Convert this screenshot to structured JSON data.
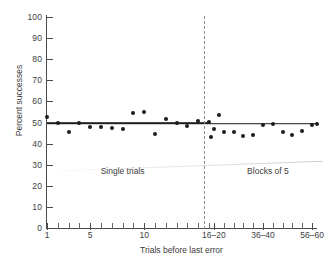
{
  "chart_data": {
    "type": "scatter",
    "title": "",
    "xlabel": "Trials before last error",
    "ylabel": "Percent successes",
    "ylim": [
      0,
      100
    ],
    "ytick_values": [
      0,
      10,
      20,
      30,
      40,
      50,
      60,
      70,
      80,
      90,
      100
    ],
    "ytick_labels": [
      "0",
      "10",
      "20",
      "30",
      "40",
      "50",
      "60",
      "70",
      "80",
      "90",
      "100"
    ],
    "xtick_labels": [
      "1",
      "5",
      "10",
      "16–20",
      "36–40",
      "56–60"
    ],
    "xtick_label_positions": [
      1,
      5,
      10,
      18,
      38,
      58
    ],
    "grid": false,
    "legend": null,
    "annotations": [
      {
        "text": "Single trials",
        "x": 8.0,
        "y": 27
      },
      {
        "text": "Blocks of 5",
        "x": 40.0,
        "y": 27
      }
    ],
    "divider": {
      "x": 15.5,
      "style": "dashed",
      "label": "single trials / blocks of 5 boundary"
    },
    "reference_level": 50,
    "series": [
      {
        "name": "Percent successes",
        "x": [
          1,
          2,
          3,
          4,
          5,
          6,
          7,
          8,
          9,
          10,
          11,
          12,
          13,
          14,
          15,
          16,
          17,
          18,
          20,
          22,
          26,
          30,
          34,
          38,
          42,
          46,
          50,
          54,
          58,
          60
        ],
        "y": [
          52.5,
          49.8,
          45.5,
          49.8,
          47.8,
          47.8,
          47.2,
          47.0,
          54.7,
          55.2,
          44.7,
          51.7,
          49.8,
          48.2,
          50.5,
          50.3,
          43.2,
          46.7,
          53.6,
          45.5,
          45.6,
          43.7,
          44.3,
          48.7,
          49.4,
          45.5,
          44.0,
          46.0,
          49.0,
          49.4
        ]
      }
    ],
    "fit_lines": [
      {
        "name": "single-trials-fit",
        "x0": 1,
        "x1": 16,
        "y0": 50.0,
        "y1": 49.6
      },
      {
        "name": "blocks-of-5-fit",
        "x0": 16,
        "x1": 60,
        "y0": 49.6,
        "y1": 49.3
      }
    ],
    "colors": {
      "point": "#1c1c1c",
      "fit_line": "#1c1c1c",
      "axis": "#4a4a4a",
      "divider": "#8a8a8a",
      "text": "#3d3d3d",
      "background": "#ffffff"
    }
  }
}
